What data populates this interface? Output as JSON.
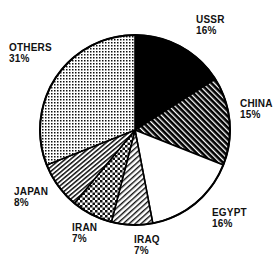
{
  "chart_data": {
    "type": "pie",
    "title": "",
    "subtitle": "",
    "xlabel": "",
    "ylabel": "",
    "legend_position": "none",
    "grid": false,
    "labels_show_percent": true,
    "start_angle_deg": 0,
    "direction": "clockwise",
    "categories": [
      "USSR",
      "CHINA",
      "EGYPT",
      "IRAQ",
      "IRAN",
      "JAPAN",
      "OTHERS"
    ],
    "values": [
      16,
      15,
      16,
      7,
      7,
      8,
      31
    ],
    "total": 100,
    "units": "%",
    "slices": [
      {
        "name": "USSR",
        "label": "USSR",
        "value": 16,
        "value_text": "16%",
        "fill": "solid-black",
        "fill_color": "#000000",
        "start_deg": 0,
        "end_deg": 57.6
      },
      {
        "name": "CHINA",
        "label": "CHINA",
        "value": 15,
        "value_text": "15%",
        "fill": "diagonal-hatch-dense",
        "fill_color": "#1a1a1a",
        "start_deg": 57.6,
        "end_deg": 111.6
      },
      {
        "name": "EGYPT",
        "label": "EGYPT",
        "value": 16,
        "value_text": "16%",
        "fill": "solid-white",
        "fill_color": "#ffffff",
        "start_deg": 111.6,
        "end_deg": 169.2
      },
      {
        "name": "IRAQ",
        "label": "IRAQ",
        "value": 7,
        "value_text": "7%",
        "fill": "diagonal-hatch-light",
        "fill_color": "#444444",
        "start_deg": 169.2,
        "end_deg": 194.4
      },
      {
        "name": "IRAN",
        "label": "IRAN",
        "value": 7,
        "value_text": "7%",
        "fill": "checkered-dots",
        "fill_color": "#333333",
        "start_deg": 194.4,
        "end_deg": 219.6
      },
      {
        "name": "JAPAN",
        "label": "JAPAN",
        "value": 8,
        "value_text": "8%",
        "fill": "diagonal-hatch-medium",
        "fill_color": "#3a3a3a",
        "start_deg": 219.6,
        "end_deg": 248.4
      },
      {
        "name": "OTHERS",
        "label": "OTHERS",
        "value": 31,
        "value_text": "31%",
        "fill": "fine-stipple",
        "fill_color": "#777777",
        "start_deg": 248.4,
        "end_deg": 360
      }
    ],
    "outline_color": "#000000",
    "background_color": "#ffffff"
  }
}
